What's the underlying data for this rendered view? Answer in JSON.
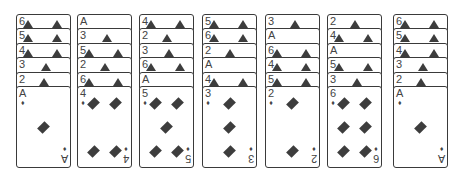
{
  "game": "solitaire-tableau",
  "suit": "diamonds",
  "suit_symbol": "♦",
  "colors": {
    "ink": "#3d3d3d",
    "card_bg": "#ffffff",
    "border": "#3a3a3a"
  },
  "columns": [
    {
      "stacked": [
        "6",
        "5",
        "4",
        "3",
        "2"
      ],
      "face_up": "A"
    },
    {
      "stacked": [
        "A",
        "3",
        "5",
        "2",
        "6"
      ],
      "face_up": "4"
    },
    {
      "stacked": [
        "4",
        "2",
        "3",
        "6",
        "A"
      ],
      "face_up": "5"
    },
    {
      "stacked": [
        "5",
        "6",
        "2",
        "A",
        "4"
      ],
      "face_up": "3"
    },
    {
      "stacked": [
        "3",
        "A",
        "6",
        "4",
        "5"
      ],
      "face_up": "2"
    },
    {
      "stacked": [
        "2",
        "4",
        "A",
        "5",
        "3"
      ],
      "face_up": "6"
    },
    {
      "stacked": [
        "6",
        "5",
        "4",
        "3",
        "2"
      ],
      "face_up": "A"
    }
  ]
}
